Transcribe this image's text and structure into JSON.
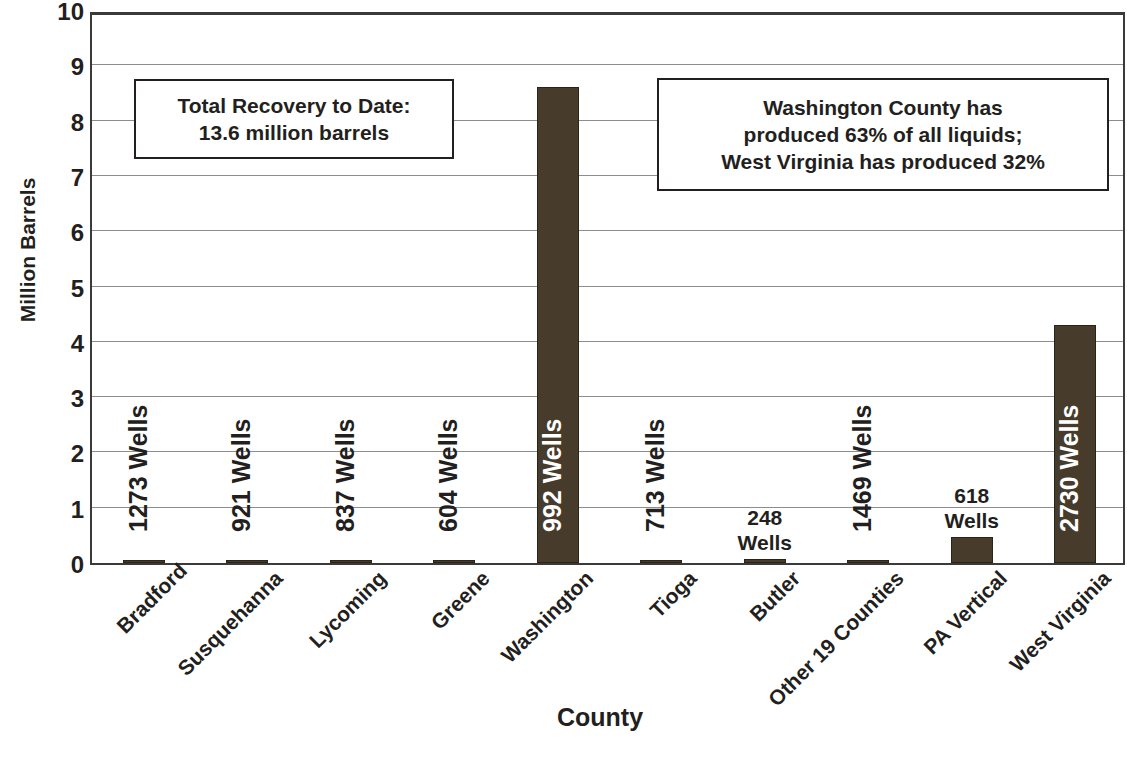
{
  "chart_data": {
    "type": "bar",
    "title": "",
    "xlabel": "County",
    "ylabel": "Million Barrels",
    "ylim": [
      0,
      10
    ],
    "ytick_labels": [
      "10",
      "9",
      "8",
      "7",
      "6",
      "5",
      "4",
      "3",
      "2",
      "1",
      "0"
    ],
    "yticks": [
      10,
      9,
      8,
      7,
      6,
      5,
      4,
      3,
      2,
      1,
      0
    ],
    "grid": true,
    "legend": "none",
    "bar_color": "#473c2c",
    "categories": [
      "Bradford",
      "Susquehanna",
      "Lycoming",
      "Greene",
      "Washington",
      "Tioga",
      "Butler",
      "Other 19 Counties",
      "PA Vertical",
      "West Virginia"
    ],
    "values": [
      0.02,
      0.02,
      0.02,
      0.03,
      8.6,
      0.02,
      0.07,
      0.02,
      0.47,
      4.3
    ],
    "point_labels": [
      "1273 Wells",
      "921 Wells",
      "837 Wells",
      "604 Wells",
      "992 Wells",
      "713 Wells",
      "248 Wells",
      "1469 Wells",
      "618 Wells",
      "2730 Wells"
    ],
    "well_counts": [
      1273,
      921,
      837,
      604,
      992,
      713,
      248,
      1469,
      618,
      2730
    ],
    "annotations": [
      {
        "name": "total-recovery",
        "lines": [
          "Total Recovery to Date:",
          "13.6 million barrels"
        ]
      },
      {
        "name": "production-share",
        "lines": [
          "Washington County has",
          "produced 63% of all liquids;",
          "West Virginia has produced 32%"
        ]
      }
    ]
  },
  "bars": [
    {
      "label": "1273 Wells",
      "label_style": "rotated",
      "label_on_bar": false
    },
    {
      "label": "921 Wells",
      "label_style": "rotated",
      "label_on_bar": false
    },
    {
      "label": "837 Wells",
      "label_style": "rotated",
      "label_on_bar": false
    },
    {
      "label": "604 Wells",
      "label_style": "rotated",
      "label_on_bar": false
    },
    {
      "label": "992 Wells",
      "label_style": "rotated",
      "label_on_bar": true
    },
    {
      "label": "713 Wells",
      "label_style": "rotated",
      "label_on_bar": false
    },
    {
      "label": "248\nWells",
      "label_style": "flat",
      "label_line1": "248",
      "label_line2": "Wells",
      "label_on_bar": false
    },
    {
      "label": "1469 Wells",
      "label_style": "rotated",
      "label_on_bar": false
    },
    {
      "label": "618\nWells",
      "label_style": "flat",
      "label_line1": "618",
      "label_line2": "Wells",
      "label_on_bar": false
    },
    {
      "label": "2730 Wells",
      "label_style": "rotated",
      "label_on_bar": true
    }
  ],
  "annotation_total": {
    "line1": "Total Recovery to Date:",
    "line2": "13.6 million barrels"
  },
  "annotation_share": {
    "line1": "Washington County has",
    "line2": "produced 63% of all liquids;",
    "line3": "West Virginia has produced 32%"
  }
}
